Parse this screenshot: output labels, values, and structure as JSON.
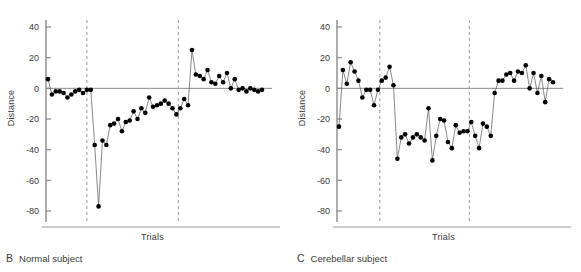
{
  "figure": {
    "panels": [
      {
        "id": "B",
        "caption_letter": "B",
        "caption_text": "Normal subject"
      },
      {
        "id": "C",
        "caption_letter": "C",
        "caption_text": "Cerebellar subject"
      }
    ]
  },
  "chart_data": [
    {
      "type": "scatter",
      "panel": "B",
      "title": "B  Normal subject",
      "xlabel": "Trials",
      "ylabel": "Distance",
      "ylim": [
        -90,
        48
      ],
      "xlim": [
        0,
        58
      ],
      "yticks": [
        40,
        20,
        0,
        -20,
        -40,
        -60,
        -80
      ],
      "ytick_labels": [
        "40",
        "20",
        "0",
        "-20",
        "-40",
        "-60",
        "-80"
      ],
      "grid": false,
      "legend": "none",
      "markers": "filled-circle",
      "line": "thin-connecting",
      "reference_lines": {
        "horizontal_zero": 0,
        "vertical_dashed": [
          11.0,
          34.5
        ]
      },
      "x": [
        1,
        2,
        3,
        4,
        5,
        6,
        7,
        8,
        9,
        10,
        11,
        12,
        13,
        14,
        15,
        16,
        17,
        18,
        19,
        20,
        21,
        22,
        23,
        24,
        25,
        26,
        27,
        28,
        29,
        30,
        31,
        32,
        33,
        34,
        35,
        36,
        37,
        38,
        39,
        40,
        41,
        42,
        43,
        44,
        45,
        46,
        47,
        48,
        49,
        50,
        51,
        52,
        53,
        54,
        55,
        56
      ],
      "values": [
        6,
        -4,
        -2,
        -2,
        -3,
        -6,
        -4,
        -2,
        -1,
        -3,
        -1,
        -1,
        -37,
        -77,
        -34,
        -37,
        -24,
        -23,
        -20,
        -28,
        -22,
        -21,
        -15,
        -20,
        -13,
        -16,
        -6,
        -12,
        -11,
        -10,
        -8,
        -10,
        -13,
        -17,
        -13,
        -7,
        -11,
        25,
        9,
        8,
        6,
        12,
        4,
        3,
        8,
        4,
        10,
        0,
        6,
        -1,
        0,
        -2,
        0,
        -1,
        -2,
        -1
      ]
    },
    {
      "type": "scatter",
      "panel": "C",
      "title": "C  Cerebellar subject",
      "xlabel": "Trials",
      "ylabel": "Distance",
      "ylim": [
        -90,
        48
      ],
      "xlim": [
        0,
        58
      ],
      "yticks": [
        40,
        20,
        0,
        -20,
        -40,
        -60,
        -80
      ],
      "ytick_labels": [
        "40",
        "20",
        "0",
        "-20",
        "-40",
        "-60",
        "-80"
      ],
      "grid": false,
      "legend": "none",
      "markers": "filled-circle",
      "line": "thin-connecting",
      "reference_lines": {
        "horizontal_zero": 0,
        "vertical_dashed": [
          11.5,
          34.5
        ]
      },
      "x": [
        1,
        2,
        3,
        4,
        5,
        6,
        7,
        8,
        9,
        10,
        11,
        12,
        13,
        14,
        15,
        16,
        17,
        18,
        19,
        20,
        21,
        22,
        23,
        24,
        25,
        26,
        27,
        28,
        29,
        30,
        31,
        32,
        33,
        34,
        35,
        36,
        37,
        38,
        39,
        40,
        41,
        42,
        43,
        44,
        45,
        46,
        47,
        48,
        49,
        50,
        51,
        52,
        53,
        54,
        55,
        56
      ],
      "values": [
        -25,
        12,
        3,
        17,
        11,
        5,
        -6,
        -1,
        -1,
        -11,
        -1,
        5,
        7,
        14,
        2,
        -46,
        -32,
        -30,
        -36,
        -32,
        -30,
        -32,
        -34,
        -13,
        -47,
        -31,
        -20,
        -21,
        -35,
        -39,
        -24,
        -29,
        -28,
        -28,
        -22,
        -31,
        -39,
        -23,
        -25,
        -31,
        -3,
        5,
        5,
        9,
        10,
        5,
        11,
        10,
        15,
        0,
        10,
        -3,
        8,
        -9,
        6,
        4
      ]
    }
  ],
  "labels": {
    "y_axis": "Distance",
    "x_axis": "Trials"
  },
  "colors": {
    "marker": "#000000",
    "line": "#555555",
    "axis": "#8a8a8a",
    "dashed": "#999999",
    "text": "#3a3a3a"
  }
}
